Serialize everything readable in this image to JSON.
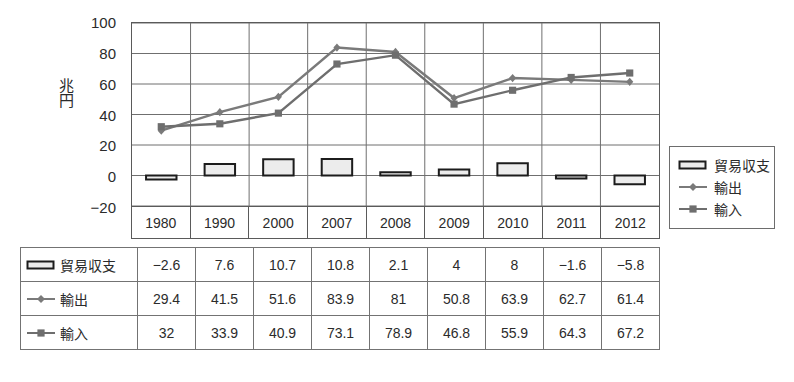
{
  "chart_data": {
    "type": "bar",
    "title": "",
    "xlabel": "",
    "ylabel": "兆円",
    "ylim": [
      -20,
      100
    ],
    "ytick_step": 20,
    "yticks": [
      "100",
      "80",
      "60",
      "40",
      "20",
      "0",
      "-20"
    ],
    "grid": true,
    "legend_position": "right",
    "categories": [
      "1980",
      "1990",
      "2000",
      "2007",
      "2008",
      "2009",
      "2010",
      "2011",
      "2012"
    ],
    "series": [
      {
        "name": "貿易収支",
        "type": "bar",
        "marker": "rect",
        "color": "#1c1c1c",
        "fill": "#ececec",
        "values": [
          -2.6,
          7.6,
          10.7,
          10.8,
          2.1,
          4,
          8,
          -1.6,
          -5.8
        ],
        "labels": [
          "-2.6",
          "7.6",
          "10.7",
          "10.8",
          "2.1",
          "4",
          "8",
          "-1.6",
          "-5.8"
        ]
      },
      {
        "name": "輸出",
        "type": "line",
        "marker": "diamond",
        "color": "#7a7a7a",
        "values": [
          29.4,
          41.5,
          51.6,
          83.9,
          81,
          50.8,
          63.9,
          62.7,
          61.4
        ],
        "labels": [
          "29.4",
          "41.5",
          "51.6",
          "83.9",
          "81",
          "50.8",
          "63.9",
          "62.7",
          "61.4"
        ]
      },
      {
        "name": "輸入",
        "type": "line",
        "marker": "square",
        "color": "#6e6e6e",
        "values": [
          32,
          33.9,
          40.9,
          73.1,
          78.9,
          46.8,
          55.9,
          64.3,
          67.2
        ],
        "labels": [
          "32",
          "33.9",
          "40.9",
          "73.1",
          "78.9",
          "46.8",
          "55.9",
          "64.3",
          "67.2"
        ]
      }
    ]
  },
  "legend": {
    "items": [
      {
        "label": "貿易収支",
        "marker": "bar"
      },
      {
        "label": "輸出",
        "marker": "diamond-line"
      },
      {
        "label": "輸入",
        "marker": "square-line"
      }
    ]
  },
  "table": {
    "rows": [
      {
        "header": "貿易収支",
        "marker": "bar",
        "cells": [
          "-2.6",
          "7.6",
          "10.7",
          "10.8",
          "2.1",
          "4",
          "8",
          "-1.6",
          "-5.8"
        ]
      },
      {
        "header": "輸出",
        "marker": "diamond-line",
        "cells": [
          "29.4",
          "41.5",
          "51.6",
          "83.9",
          "81",
          "50.8",
          "63.9",
          "62.7",
          "61.4"
        ]
      },
      {
        "header": "輸入",
        "marker": "square-line",
        "cells": [
          "32",
          "33.9",
          "40.9",
          "73.1",
          "78.9",
          "46.8",
          "55.9",
          "64.3",
          "67.2"
        ]
      }
    ]
  }
}
